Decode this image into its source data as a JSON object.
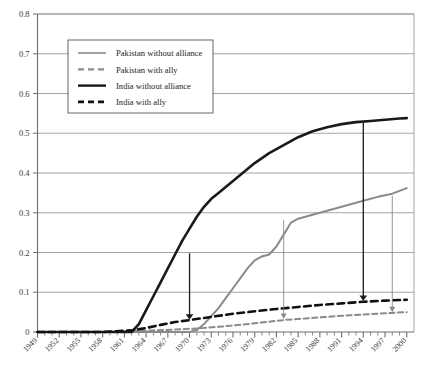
{
  "chart_data": {
    "type": "line",
    "title": "",
    "subtitle": "",
    "xlabel": "",
    "ylabel": "",
    "xlim": [
      1949,
      2001
    ],
    "ylim": [
      0,
      0.8
    ],
    "grid": "horizontal",
    "legend_position": "top-left",
    "x_tick_labels": [
      "1949",
      "1952",
      "1955",
      "1958",
      "1961",
      "1964",
      "1967",
      "1970",
      "1973",
      "1976",
      "1979",
      "1982",
      "1985",
      "1988",
      "1991",
      "1994",
      "1997",
      "2000"
    ],
    "x_tick_step": 3,
    "x_minor_tick_step": 1,
    "y_tick_labels": [
      "0",
      "0.1",
      "0.2",
      "0.3",
      "0.4",
      "0.5",
      "0.6",
      "0.7",
      "0.8"
    ],
    "y_tick_values": [
      0,
      0.1,
      0.2,
      0.3,
      0.4,
      0.5,
      0.6,
      0.7,
      0.8
    ],
    "series": [
      {
        "name": "Pakistan without alliance",
        "color": "#8a8a8a",
        "style": "solid",
        "width": 2.0,
        "x": [
          1949,
          1955,
          1961,
          1965,
          1968,
          1970,
          1971,
          1972,
          1973,
          1974,
          1975,
          1976,
          1977,
          1978,
          1979,
          1980,
          1981,
          1982,
          1983,
          1984,
          1985,
          1986,
          1987,
          1988,
          1990,
          1992,
          1994,
          1996,
          1998,
          1999,
          2000
        ],
        "values": [
          0,
          0,
          0,
          0,
          0,
          0,
          0.005,
          0.02,
          0.04,
          0.06,
          0.085,
          0.11,
          0.135,
          0.16,
          0.18,
          0.19,
          0.195,
          0.215,
          0.245,
          0.275,
          0.285,
          0.29,
          0.295,
          0.3,
          0.31,
          0.32,
          0.33,
          0.34,
          0.348,
          0.355,
          0.362
        ]
      },
      {
        "name": "Pakistan with ally",
        "color": "#8a8a8a",
        "style": "dashed",
        "width": 2.0,
        "x": [
          1949,
          1958,
          1962,
          1965,
          1968,
          1971,
          1974,
          1977,
          1980,
          1983,
          1986,
          1989,
          1992,
          1995,
          1998,
          2000
        ],
        "values": [
          0,
          0,
          0.002,
          0.004,
          0.006,
          0.009,
          0.013,
          0.018,
          0.024,
          0.03,
          0.034,
          0.038,
          0.042,
          0.045,
          0.048,
          0.05
        ]
      },
      {
        "name": "India without alliance",
        "color": "#1a1a1a",
        "style": "solid",
        "width": 2.6,
        "x": [
          1949,
          1955,
          1960,
          1962,
          1963,
          1964,
          1965,
          1966,
          1967,
          1968,
          1969,
          1970,
          1971,
          1972,
          1973,
          1974,
          1975,
          1977,
          1979,
          1981,
          1983,
          1985,
          1987,
          1989,
          1991,
          1993,
          1995,
          1997,
          1999,
          2000
        ],
        "values": [
          0,
          0,
          0,
          0,
          0.02,
          0.055,
          0.09,
          0.125,
          0.16,
          0.195,
          0.23,
          0.26,
          0.29,
          0.315,
          0.335,
          0.35,
          0.365,
          0.395,
          0.425,
          0.45,
          0.47,
          0.49,
          0.505,
          0.515,
          0.523,
          0.528,
          0.531,
          0.534,
          0.537,
          0.538
        ]
      },
      {
        "name": "India with ally",
        "color": "#111111",
        "style": "dashed",
        "width": 2.6,
        "x": [
          1949,
          1958,
          1962,
          1964,
          1966,
          1968,
          1970,
          1973,
          1976,
          1979,
          1982,
          1985,
          1988,
          1991,
          1994,
          1997,
          2000
        ],
        "values": [
          0,
          0,
          0.004,
          0.01,
          0.018,
          0.025,
          0.03,
          0.038,
          0.046,
          0.052,
          0.058,
          0.063,
          0.068,
          0.072,
          0.076,
          0.079,
          0.081
        ]
      }
    ],
    "annotations": [
      {
        "kind": "arrow",
        "label": "india-arrow-1970",
        "color": "#1a1a1a",
        "x": 1970,
        "y_from": 0.198,
        "y_to": 0.031
      },
      {
        "kind": "arrow",
        "label": "pakistan-arrow-1983",
        "color": "#8a8a8a",
        "x": 1983,
        "y_from": 0.282,
        "y_to": 0.033
      },
      {
        "kind": "arrow",
        "label": "india-arrow-1994",
        "color": "#1a1a1a",
        "x": 1994,
        "y_from": 0.528,
        "y_to": 0.078
      },
      {
        "kind": "arrow",
        "label": "pakistan-arrow-1998",
        "color": "#8a8a8a",
        "x": 1998,
        "y_from": 0.343,
        "y_to": 0.05
      }
    ]
  },
  "legend": {
    "items": [
      {
        "label": "Pakistan without alliance"
      },
      {
        "label": "Pakistan with ally"
      },
      {
        "label": "India without alliance"
      },
      {
        "label": "India with ally"
      }
    ]
  }
}
